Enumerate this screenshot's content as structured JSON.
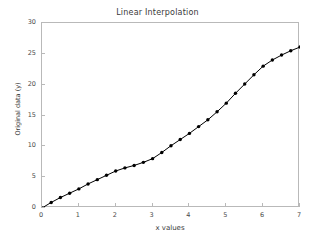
{
  "chart_data": {
    "type": "line",
    "title": "Linear Interpolation",
    "xlabel": "x values",
    "ylabel": "Original data (y)",
    "xlim": [
      0,
      7
    ],
    "ylim": [
      0,
      30
    ],
    "xticks": [
      0,
      1,
      2,
      3,
      4,
      5,
      6,
      7
    ],
    "yticks": [
      0,
      5,
      10,
      15,
      20,
      25,
      30
    ],
    "grid": false,
    "legend": null,
    "marker": "circle-filled",
    "line_color": "#000000",
    "marker_color": "#000000",
    "x": [
      0,
      0.25,
      0.5,
      0.75,
      1,
      1.25,
      1.5,
      1.75,
      2,
      2.25,
      2.5,
      2.75,
      3,
      3.25,
      3.5,
      3.75,
      4,
      4.25,
      4.5,
      4.75,
      5,
      5.25,
      5.5,
      5.75,
      6,
      6.25,
      6.5,
      6.75,
      7
    ],
    "values": [
      0,
      0.9,
      1.7,
      2.4,
      3.1,
      3.9,
      4.6,
      5.3,
      6.0,
      6.5,
      6.9,
      7.4,
      8.0,
      9.0,
      10.1,
      11.1,
      12.1,
      13.2,
      14.3,
      15.6,
      17.0,
      18.6,
      20.1,
      21.6,
      23.0,
      24.0,
      24.8,
      25.5,
      26.1
    ],
    "series": [
      {
        "name": "Original data",
        "values": [
          0,
          0.9,
          1.7,
          2.4,
          3.1,
          3.9,
          4.6,
          5.3,
          6.0,
          6.5,
          6.9,
          7.4,
          8.0,
          9.0,
          10.1,
          11.1,
          12.1,
          13.2,
          14.3,
          15.6,
          17.0,
          18.6,
          20.1,
          21.6,
          23.0,
          24.0,
          24.8,
          25.5,
          26.1
        ]
      }
    ]
  },
  "figure": {
    "background_color": "#ffffff",
    "axis_color": "#b9b9b9",
    "text_color": "#3a3a3a"
  }
}
